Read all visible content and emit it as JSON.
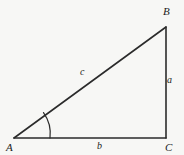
{
  "figure": {
    "type": "right-triangle-diagram",
    "background_color": "#f7f7f5",
    "stroke_color": "#2b2b2b",
    "vertices": [
      {
        "name": "A",
        "label": "A",
        "x": 14,
        "y": 138
      },
      {
        "name": "B",
        "label": "B",
        "x": 166,
        "y": 27
      },
      {
        "name": "C",
        "label": "C",
        "x": 166,
        "y": 138
      }
    ],
    "sides": [
      {
        "name": "a",
        "label": "a",
        "from": "B",
        "to": "C",
        "description": "vertical leg opposite angle A"
      },
      {
        "name": "b",
        "label": "b",
        "from": "A",
        "to": "C",
        "description": "horizontal base leg"
      },
      {
        "name": "c",
        "label": "c",
        "from": "A",
        "to": "B",
        "description": "hypotenuse"
      }
    ],
    "angle_marks": [
      {
        "at": "A",
        "type": "arc",
        "radius": 36
      }
    ]
  }
}
